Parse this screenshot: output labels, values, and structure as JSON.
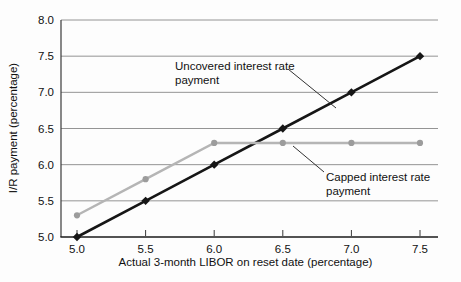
{
  "figure": {
    "background": "#fdfdfd"
  },
  "chart_data": {
    "type": "line",
    "title": "",
    "xlabel": "Actual 3-month LIBOR on reset date (percentage)",
    "ylabel": "I/R payment (percentage)",
    "xlim": [
      5.0,
      7.5
    ],
    "ylim": [
      5.0,
      8.0
    ],
    "x_ticks": [
      5.0,
      5.5,
      6.0,
      6.5,
      7.0,
      7.5
    ],
    "x_tick_labels": [
      "5.0",
      "5.5",
      "6.0",
      "6.5",
      "7.0",
      "7.5"
    ],
    "y_ticks": [
      5.0,
      5.5,
      6.0,
      6.5,
      7.0,
      7.5,
      8.0
    ],
    "y_tick_labels": [
      "5.0",
      "5.5",
      "6.0",
      "6.5",
      "7.0",
      "7.5",
      "8.0"
    ],
    "grid": "horizontal-only",
    "legend_position": "inline-annotations",
    "x": [
      5.0,
      5.5,
      6.0,
      6.5,
      7.0,
      7.5
    ],
    "series": [
      {
        "name": "Uncovered interest rate payment",
        "values": [
          5.0,
          5.5,
          6.0,
          6.5,
          7.0,
          7.5
        ],
        "color": "#161616",
        "marker": "diamond",
        "marker_color": "#161616",
        "line_width": 2.6
      },
      {
        "name": "Capped interest rate payment",
        "values": [
          5.3,
          5.8,
          6.3,
          6.3,
          6.3,
          6.3
        ],
        "color": "#b5b5b5",
        "marker": "circle",
        "marker_color": "#9c9c9c",
        "line_width": 2.4
      }
    ],
    "annotations": [
      {
        "id": "uncovered",
        "lines": [
          "Uncovered interest rate",
          "payment"
        ]
      },
      {
        "id": "capped",
        "lines": [
          "Capped interest rate",
          "payment"
        ]
      }
    ],
    "colors": {
      "grid": "#949494",
      "x_axis": "#1a1a1a",
      "y_axis": "#3a3a3a",
      "leader": "#333333",
      "text": "#111111"
    }
  }
}
